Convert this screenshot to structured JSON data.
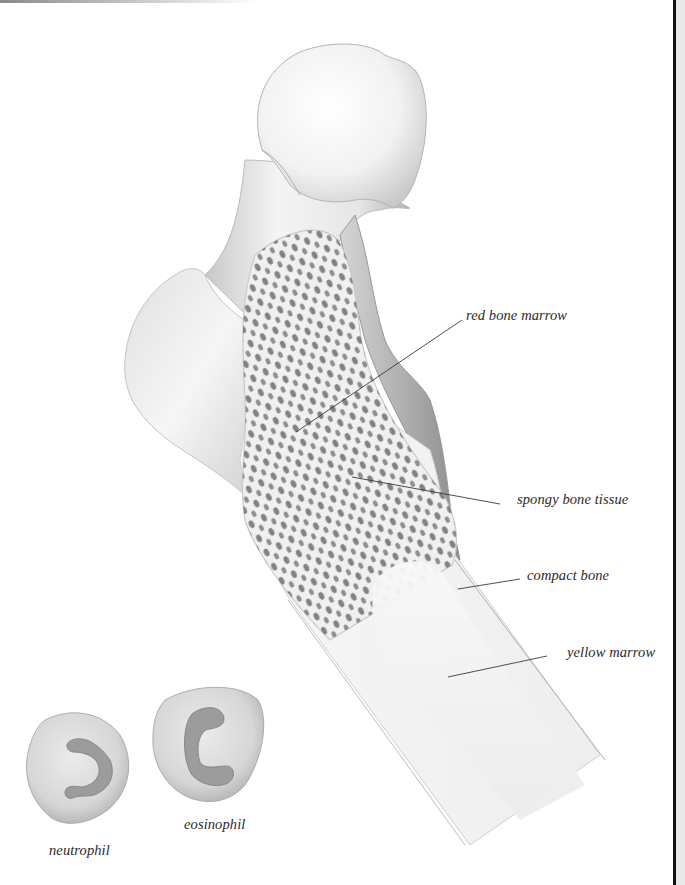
{
  "figure": {
    "labels": [
      {
        "id": "red-bone-marrow",
        "text": "red bone marrow"
      },
      {
        "id": "spongy-bone-tissue",
        "text": "spongy bone tissue"
      },
      {
        "id": "compact-bone",
        "text": "compact bone"
      },
      {
        "id": "yellow-marrow",
        "text": "yellow marrow"
      }
    ],
    "cells": [
      {
        "id": "neutrophil",
        "text": "neutrophil"
      },
      {
        "id": "eosinophil",
        "text": "eosinophil"
      }
    ]
  },
  "colors": {
    "background": "#ffffff",
    "bone_light": "#f2f2f2",
    "bone_shade": "#bdbdbd",
    "pore": "#6e6e6e",
    "leader_line": "#3a3a3a",
    "cell_body": "#d9d9d9",
    "nucleus": "#9a9a9a",
    "page_rule": "#111111"
  }
}
